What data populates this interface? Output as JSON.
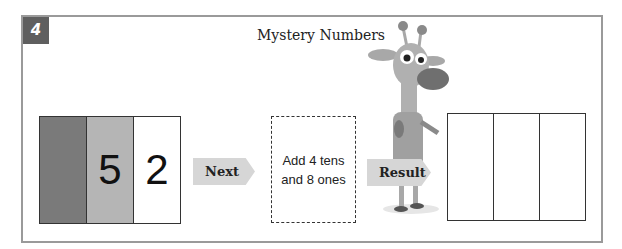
{
  "exercise": {
    "number": "4",
    "title": "Mystery Numbers"
  },
  "place_value_chart": {
    "columns": [
      {
        "name": "hundreds",
        "value": ""
      },
      {
        "name": "tens",
        "value": "5"
      },
      {
        "name": "ones",
        "value": "2"
      }
    ]
  },
  "next_arrow": {
    "label": "Next"
  },
  "instruction": {
    "line1": "Add 4 tens",
    "line2": "and 8 ones"
  },
  "result_arrow": {
    "label": "Result"
  },
  "result_chart": {
    "columns": [
      {
        "name": "hundreds",
        "value": ""
      },
      {
        "name": "tens",
        "value": ""
      },
      {
        "name": "ones",
        "value": ""
      }
    ]
  },
  "mascot": {
    "name": "giraffe-mascot"
  }
}
